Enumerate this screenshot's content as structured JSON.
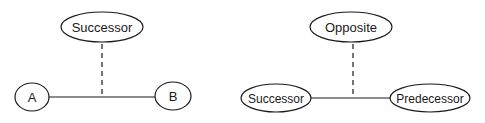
{
  "diagrams": [
    {
      "name": "left",
      "top_node": {
        "label": "Successor",
        "cx": 102,
        "cy": 27,
        "rx": 41,
        "ry": 15
      },
      "left_node": {
        "label": "A",
        "cx": 32,
        "cy": 97,
        "rx": 17,
        "ry": 14
      },
      "right_node": {
        "label": "B",
        "cx": 173,
        "cy": 96,
        "rx": 18,
        "ry": 14
      },
      "link": {
        "x1": 49,
        "x2": 155,
        "y": 97
      },
      "dashed": {
        "x": 102,
        "y1": 44,
        "y2": 97
      }
    },
    {
      "name": "right",
      "top_node": {
        "label": "Opposite",
        "cx": 351,
        "cy": 27,
        "rx": 41,
        "ry": 15
      },
      "left_node": {
        "label": "Successor",
        "cx": 276,
        "cy": 98,
        "rx": 35,
        "ry": 14
      },
      "right_node": {
        "label": "Predecessor",
        "cx": 430,
        "cy": 98,
        "rx": 40,
        "ry": 14
      },
      "link": {
        "x1": 311,
        "x2": 390,
        "y": 98
      },
      "dashed": {
        "x": 353,
        "y1": 44,
        "y2": 98
      }
    }
  ],
  "colors": {
    "stroke": "#1a1a1a",
    "background": "#ffffff"
  }
}
